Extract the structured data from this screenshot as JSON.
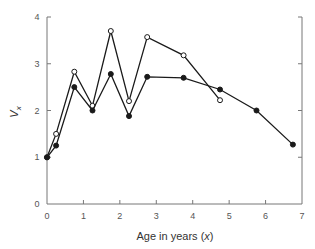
{
  "chart_data": {
    "type": "line",
    "title": "",
    "xlabel": "Age in years (x)",
    "xlabel_parts": {
      "prefix": "Age in years (",
      "italic": "x",
      "suffix": ")"
    },
    "ylabel": "V_x",
    "ylabel_parts": {
      "main": "V",
      "sub": "x"
    },
    "xlim": [
      0,
      7
    ],
    "ylim": [
      0,
      4
    ],
    "xticks": [
      "0",
      "1",
      "2",
      "3",
      "4",
      "5",
      "6",
      "7"
    ],
    "yticks": [
      "0",
      "1",
      "2",
      "3",
      "4"
    ],
    "grid": false,
    "legend": null,
    "series": [
      {
        "name": "open-circles",
        "marker": "open-circle",
        "x": [
          0,
          0.25,
          0.75,
          1.25,
          1.75,
          2.25,
          2.75,
          3.75,
          4.75
        ],
        "y": [
          1.0,
          1.5,
          2.83,
          2.1,
          3.7,
          2.2,
          3.57,
          3.18,
          2.22
        ]
      },
      {
        "name": "filled-circles",
        "marker": "filled-circle",
        "x": [
          0,
          0.25,
          0.75,
          1.25,
          1.75,
          2.25,
          2.75,
          3.75,
          4.75,
          5.75,
          6.75
        ],
        "y": [
          1.0,
          1.25,
          2.5,
          2.0,
          2.78,
          1.88,
          2.72,
          2.7,
          2.45,
          2.0,
          1.27
        ]
      }
    ]
  },
  "colors": {
    "line": "#1a1a1a",
    "axis": "#777777",
    "text": "#555555"
  }
}
